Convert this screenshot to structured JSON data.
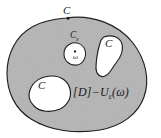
{
  "figure": {
    "kind": "math-region-diagram",
    "background_color": "#ffffff",
    "region_fill_color": "#b9b9b9",
    "hole_fill_color": "#ffffff",
    "stroke_color": "#1f1f1f",
    "labels": {
      "curve_top": "C",
      "curve_left": "C",
      "curve_right": "C",
      "epsilon_circle": "C",
      "epsilon_circle_subscript": "ε",
      "omega_point": "ω",
      "formula_bracket_open": "[",
      "formula_domain": "D",
      "formula_bracket_close": "]",
      "formula_minus": "−",
      "formula_u": "U",
      "formula_u_subscript": "ε",
      "formula_paren_open": "(",
      "formula_argument": "ω",
      "formula_paren_close": ")",
      "formula_full": "[D]−Uε(ω)"
    }
  }
}
